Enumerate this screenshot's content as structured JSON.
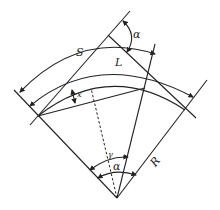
{
  "diagram": {
    "type": "geometry",
    "labels": {
      "alpha_top": "α",
      "S": "S",
      "L": "L",
      "x": "x",
      "gamma": "γ",
      "alpha_bottom": "α",
      "R": "R"
    },
    "colors": {
      "line": "#222222",
      "background": "#ffffff"
    }
  }
}
